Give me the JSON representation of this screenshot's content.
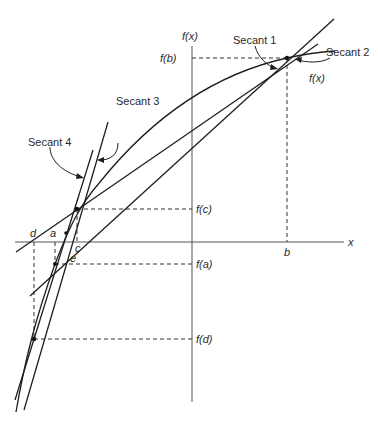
{
  "diagram": {
    "type": "secant-method-illustration",
    "axes": {
      "y_label": "f(x)",
      "x_label": "x"
    },
    "curve_label": "f(x)",
    "secant_labels": [
      "Secant 1",
      "Secant 2",
      "Secant 3",
      "Secant 4"
    ],
    "x_points": [
      "d",
      "a",
      "c",
      "e",
      "b"
    ],
    "y_values": [
      "f(b)",
      "f(c)",
      "f(a)",
      "f(d)"
    ],
    "colors": {
      "line": "#1e1e1e",
      "axis": "#555555",
      "dashed": "#333333"
    }
  }
}
